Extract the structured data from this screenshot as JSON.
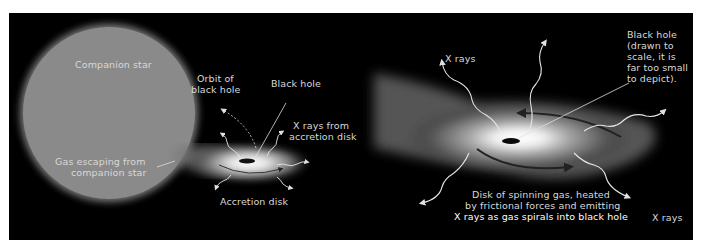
{
  "figure": {
    "left_panel": {
      "name": "binary-system-overview",
      "labels": {
        "companion_star": "Companion star",
        "orbit_line1": "Orbit of",
        "orbit_line2": "black hole",
        "black_hole": "Black hole",
        "xrays_line1": "X rays from",
        "xrays_line2": "accretion disk",
        "gas_line1": "Gas escaping from",
        "gas_line2": "companion star",
        "accretion_disk": "Accretion disk"
      }
    },
    "right_panel": {
      "name": "accretion-disk-closeup",
      "labels": {
        "xrays_top_left": "X rays",
        "black_hole_note_line1": "Black hole",
        "black_hole_note_line2": "(drawn to",
        "black_hole_note_line3": "scale, it is",
        "black_hole_note_line4": "far too small",
        "black_hole_note_line5": "to depict).",
        "disk_line1": "Disk of spinning gas, heated",
        "disk_line2": "by frictional forces and emitting",
        "disk_line3": "X rays as gas spirals into black hole",
        "xrays_bottom_right": "X rays"
      }
    },
    "colors": {
      "background": "#000000",
      "frame": "#ffffff",
      "star": "#8c8c8c",
      "label_text": "#d8d8d8",
      "disk_glow": "#ffffff"
    }
  }
}
